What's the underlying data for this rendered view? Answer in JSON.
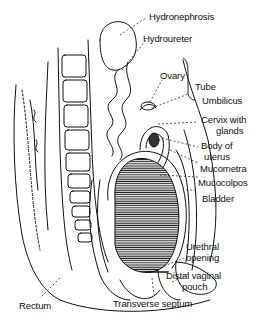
{
  "diagram": {
    "type": "anatomical-illustration",
    "labels": {
      "hydronephrosis": "Hydronephrosis",
      "hydroureter": "Hydroureter",
      "ovary": "Ovary",
      "tube": "Tube",
      "umbilicus": "Umbilicus",
      "cervix_line1": "Cervix with",
      "cervix_line2": "glands",
      "body_line1": "Body of",
      "body_line2": "uterus",
      "mucometra": "Mucometra",
      "mucocolpos": "Mucocolpos",
      "bladder": "Bladder",
      "urethral_line1": "Urethral",
      "urethral_line2": "opening",
      "distal_line1": "Distal vaginal",
      "distal_line2": "pouch",
      "transverse_septum": "Transverse septum",
      "rectum": "Rectum"
    },
    "colors": {
      "ink": "#111111",
      "background": "#ffffff"
    }
  }
}
